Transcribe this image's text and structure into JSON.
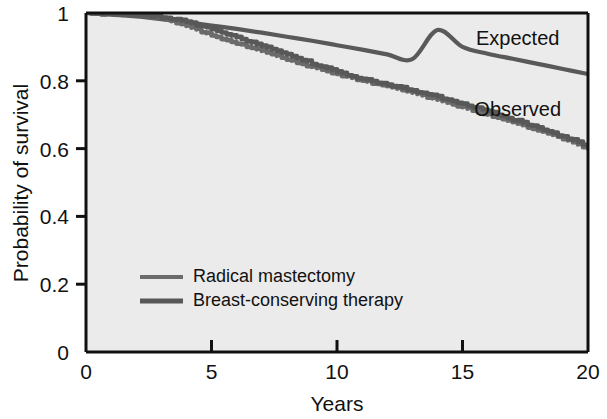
{
  "chart_data": {
    "type": "line",
    "title": "",
    "xlabel": "Years",
    "ylabel": "Probability of survival",
    "xlim": [
      0,
      20
    ],
    "ylim": [
      0,
      1
    ],
    "xticks": [
      "0",
      "5",
      "10",
      "15",
      "20"
    ],
    "xtick_values": [
      0,
      5,
      10,
      15,
      20
    ],
    "yticks": [
      "0",
      "0.2",
      "0.4",
      "0.6",
      "0.8",
      "1"
    ],
    "ytick_values": [
      0,
      0.2,
      0.4,
      0.6,
      0.8,
      1
    ],
    "grid": false,
    "legend_position": "inside-lower-left",
    "annotations": [
      {
        "text": "Expected",
        "x": 17.2,
        "y": 0.905
      },
      {
        "text": "Observed",
        "x": 17.2,
        "y": 0.695
      }
    ],
    "x": [
      0,
      1,
      2,
      3,
      4,
      5,
      6,
      7,
      8,
      9,
      10,
      11,
      12,
      13,
      14,
      15,
      16,
      17,
      18,
      19,
      20
    ],
    "series": [
      {
        "name": "Expected",
        "label": "Expected",
        "color": "#595959",
        "values": [
          1.0,
          0.995,
          0.99,
          0.982,
          0.973,
          0.963,
          0.953,
          0.942,
          0.93,
          0.918,
          0.905,
          0.892,
          0.878,
          0.864,
          0.95,
          0.9,
          0.88,
          0.865,
          0.85,
          0.835,
          0.82
        ]
      },
      {
        "name": "Radical mastectomy",
        "label": "Radical mastectomy",
        "color": "#6b6b6b",
        "values": [
          1.0,
          0.998,
          0.994,
          0.985,
          0.962,
          0.935,
          0.912,
          0.888,
          0.864,
          0.841,
          0.82,
          0.801,
          0.784,
          0.765,
          0.744,
          0.722,
          0.7,
          0.678,
          0.655,
          0.63,
          0.6
        ]
      },
      {
        "name": "Breast-conserving therapy",
        "label": "Breast-conserving therapy",
        "color": "#585858",
        "values": [
          1.0,
          0.998,
          0.995,
          0.988,
          0.974,
          0.955,
          0.928,
          0.902,
          0.878,
          0.852,
          0.826,
          0.806,
          0.788,
          0.772,
          0.754,
          0.733,
          0.71,
          0.686,
          0.662,
          0.636,
          0.608
        ]
      }
    ],
    "legend_entries": [
      {
        "label": "Radical mastectomy",
        "color": "#6b6b6b"
      },
      {
        "label": "Breast-conserving therapy",
        "color": "#585858"
      }
    ]
  },
  "colors": {
    "plot_background": "#ebebeb",
    "axis": "#111111",
    "text": "#111111"
  }
}
